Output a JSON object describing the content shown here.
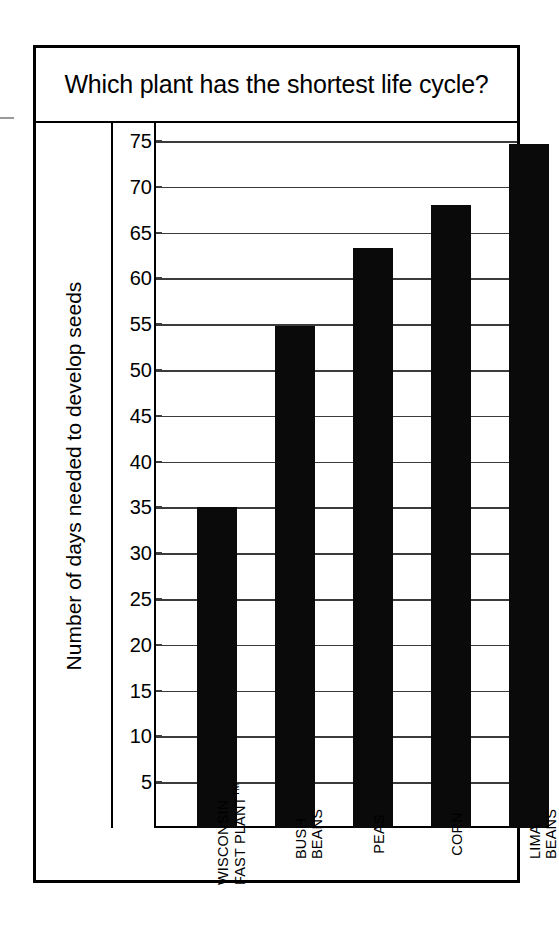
{
  "figure": {
    "title": "Which plant has the shortest life cycle?"
  },
  "axes": {
    "y_title": "Number of days needed to develop seeds",
    "y_ticks": [
      75,
      70,
      65,
      60,
      55,
      50,
      45,
      40,
      35,
      30,
      25,
      20,
      15,
      10,
      5
    ]
  },
  "bars": [
    {
      "label_line1": "WISCONSIN",
      "label_line2": "FAST PLANT",
      "trademark": "TM",
      "value": 35
    },
    {
      "label_line1": "BUSH",
      "label_line2": "BEANS",
      "trademark": "",
      "value": 54.8
    },
    {
      "label_line1": "PEAS",
      "label_line2": "",
      "trademark": "",
      "value": 63.3
    },
    {
      "label_line1": "CORN",
      "label_line2": "",
      "trademark": "",
      "value": 68
    },
    {
      "label_line1": "LIMA",
      "label_line2": "BEANS",
      "trademark": "",
      "value": 74.7
    }
  ],
  "colors": {
    "bar": "#0a0a0a",
    "frame": "#000000",
    "gridline": "#3b3b3b",
    "background": "#ffffff"
  },
  "chart_data": {
    "type": "bar",
    "title": "Which plant has the shortest life cycle?",
    "xlabel": "",
    "ylabel": "Number of days needed to develop seeds",
    "categories": [
      "WISCONSIN FAST PLANT™",
      "BUSH BEANS",
      "PEAS",
      "CORN",
      "LIMA BEANS"
    ],
    "values": [
      35,
      54.8,
      63.3,
      68,
      74.7
    ],
    "ylim": [
      0,
      77
    ],
    "ytick_values": [
      5,
      10,
      15,
      20,
      25,
      30,
      35,
      40,
      45,
      50,
      55,
      60,
      65,
      70,
      75
    ],
    "grid": true,
    "legend": false,
    "orientation": "vertical",
    "bar_color": "#0a0a0a"
  }
}
